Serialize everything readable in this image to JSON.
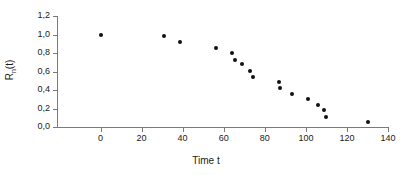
{
  "chart_data": {
    "type": "scatter",
    "title": "",
    "xlabel": "Time t",
    "ylabel": "R_n(t)",
    "ylabel_base": "R",
    "ylabel_subscript": "n",
    "ylabel_suffix": "(t)",
    "xlim": [
      -10,
      140
    ],
    "ylim": [
      0.0,
      1.2
    ],
    "x_ticks": [
      0,
      20,
      40,
      60,
      80,
      100,
      120,
      140
    ],
    "x_tick_labels": [
      "0",
      "20",
      "40",
      "60",
      "80",
      "100",
      "120",
      "140"
    ],
    "y_ticks": [
      0.0,
      0.2,
      0.4,
      0.6,
      0.8,
      1.0,
      1.2
    ],
    "y_tick_labels": [
      "0,0",
      "0,2",
      "0,4",
      "0,6",
      "0,8",
      "1,0",
      "1,2"
    ],
    "grid": false,
    "legend": null,
    "marker": "filled-circle",
    "marker_color": "#111111",
    "axis_color": "#7a7a7a",
    "background_color": "#ffffff",
    "points": [
      {
        "x": 0,
        "y": 1.0
      },
      {
        "x": 31,
        "y": 0.98
      },
      {
        "x": 38.5,
        "y": 0.92
      },
      {
        "x": 56,
        "y": 0.86
      },
      {
        "x": 64,
        "y": 0.8
      },
      {
        "x": 65.5,
        "y": 0.73
      },
      {
        "x": 69,
        "y": 0.68
      },
      {
        "x": 73,
        "y": 0.61
      },
      {
        "x": 74,
        "y": 0.54
      },
      {
        "x": 87,
        "y": 0.49
      },
      {
        "x": 87.5,
        "y": 0.42
      },
      {
        "x": 93,
        "y": 0.36
      },
      {
        "x": 101,
        "y": 0.3
      },
      {
        "x": 106,
        "y": 0.24
      },
      {
        "x": 109,
        "y": 0.18
      },
      {
        "x": 110,
        "y": 0.11
      },
      {
        "x": 130,
        "y": 0.05
      }
    ]
  }
}
